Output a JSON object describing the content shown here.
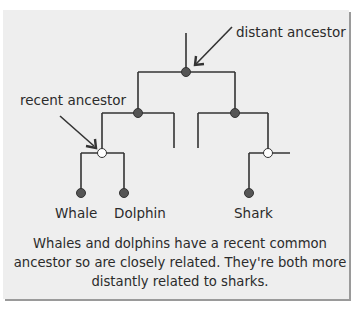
{
  "diagram": {
    "type": "phylogenetic-tree",
    "annotations": {
      "distant_ancestor": "distant ancestor",
      "recent_ancestor": "recent ancestor"
    },
    "leaves": [
      {
        "label": "Whale"
      },
      {
        "label": "Dolphin"
      },
      {
        "label": "Shark"
      }
    ],
    "caption": "Whales and dolphins have a recent common ancestor so are closely related.  They're both more distantly related to sharks.",
    "colors": {
      "panel_bg": "#eeeeee",
      "line": "#333333",
      "filled_node": "#555555",
      "open_node": "#ffffff"
    }
  }
}
